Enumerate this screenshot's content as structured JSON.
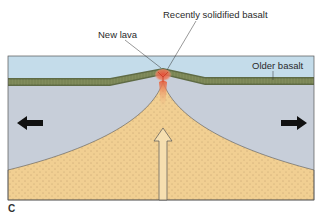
{
  "figure": {
    "panel_label": "C",
    "labels": {
      "recently_solidified": "Recently solidified basalt",
      "new_lava": "New lava",
      "older_basalt": "Older basalt"
    },
    "colors": {
      "water": "#c4dcea",
      "mantle": "#c7ced9",
      "basalt": "#5f6b45",
      "basalt_grid": "#8f9a6a",
      "magma": "#f1cf92",
      "lava": "#e8503a",
      "arrow": "#111111",
      "outline": "#555555"
    },
    "arrows": [
      {
        "direction": "left",
        "meaning": "plate divergence"
      },
      {
        "direction": "right",
        "meaning": "plate divergence"
      },
      {
        "direction": "up",
        "meaning": "magma upwelling"
      }
    ]
  }
}
